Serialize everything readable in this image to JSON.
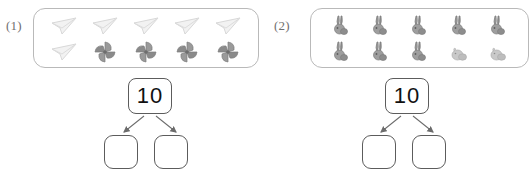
{
  "worksheet": {
    "problems": [
      {
        "label": "(1)",
        "object_box": {
          "name": "object-group-box",
          "rows": [
            {
              "items": [
                {
                  "icon": "paper-plane-icon",
                  "shade": "light"
                },
                {
                  "icon": "paper-plane-icon",
                  "shade": "light"
                },
                {
                  "icon": "paper-plane-icon",
                  "shade": "light"
                },
                {
                  "icon": "paper-plane-icon",
                  "shade": "light"
                },
                {
                  "icon": "paper-plane-icon",
                  "shade": "light"
                }
              ]
            },
            {
              "items": [
                {
                  "icon": "paper-plane-icon",
                  "shade": "light"
                },
                {
                  "icon": "pinwheel-icon",
                  "shade": "dark"
                },
                {
                  "icon": "pinwheel-icon",
                  "shade": "dark"
                },
                {
                  "icon": "pinwheel-icon",
                  "shade": "dark"
                },
                {
                  "icon": "pinwheel-icon",
                  "shade": "dark"
                }
              ]
            }
          ]
        },
        "number_bond": {
          "total": "10",
          "left_answer": "",
          "right_answer": ""
        }
      },
      {
        "label": "(2)",
        "object_box": {
          "name": "object-group-box",
          "rows": [
            {
              "items": [
                {
                  "icon": "rabbit-icon",
                  "shade": "dark"
                },
                {
                  "icon": "rabbit-icon",
                  "shade": "dark"
                },
                {
                  "icon": "rabbit-icon",
                  "shade": "dark"
                },
                {
                  "icon": "rabbit-icon",
                  "shade": "dark"
                },
                {
                  "icon": "rabbit-icon",
                  "shade": "dark"
                }
              ]
            },
            {
              "items": [
                {
                  "icon": "rabbit-icon",
                  "shade": "dark"
                },
                {
                  "icon": "rabbit-icon",
                  "shade": "dark"
                },
                {
                  "icon": "rabbit-icon",
                  "shade": "dark"
                },
                {
                  "icon": "chick-icon",
                  "shade": "light"
                },
                {
                  "icon": "chick-icon",
                  "shade": "light"
                }
              ]
            }
          ]
        },
        "number_bond": {
          "total": "10",
          "left_answer": "",
          "right_answer": ""
        }
      }
    ],
    "colors": {
      "box_border": "#b9b9b9",
      "bond_border": "#5c5c5c",
      "label_text": "#6f6f6f",
      "number_text": "#111111",
      "icon_light": "#ededed",
      "icon_dark": "#8e8e8e",
      "arrow": "#6b6b6b"
    }
  }
}
